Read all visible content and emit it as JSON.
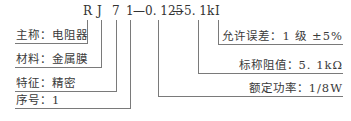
{
  "code": {
    "parts": [
      "R",
      "J",
      "7",
      "1",
      "—0. 125",
      "—5. 1k",
      "I"
    ]
  },
  "left_labels": [
    {
      "text": "主称：电阻器",
      "key": "R"
    },
    {
      "text": "材料：金属膜",
      "key": "J"
    },
    {
      "text": "特征：精密",
      "key": "7"
    },
    {
      "text": "序号：1",
      "key": "1"
    }
  ],
  "right_labels": [
    {
      "text": "允许误差：1 级 ±5%",
      "key": "I"
    },
    {
      "text": "标称阻值：5. 1kΩ",
      "key": "5.1k"
    },
    {
      "text": "额定功率：1/8W",
      "key": "0.125"
    }
  ],
  "colors": {
    "line": "#7a7a7a",
    "text": "#3a3a3a",
    "background": "#ffffff"
  }
}
